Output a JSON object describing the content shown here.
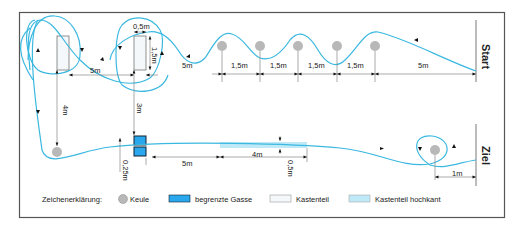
{
  "diagram": {
    "start_label": "Start",
    "finish_label": "Ziel",
    "colors": {
      "path": "#3bb8e0",
      "cone": "#b8b8b8",
      "gate": "#2aa8ee",
      "box": "#f4f8fa",
      "box_upright": "#bfe9f7",
      "frame": "#555555",
      "dim": "#888888"
    },
    "dimensions": {
      "box_width": "0,5m",
      "box_length": "1,5m",
      "boxes_gap": "5m",
      "left_vertical": "4m",
      "mid_vertical": "3m",
      "to_first_cone": "5m",
      "cone_spacing_1": "1,5m",
      "cone_spacing_2": "1,5m",
      "cone_spacing_3": "1,5m",
      "cone_spacing_4": "1,5m",
      "last_cone_to_start": "5m",
      "gate_offset": "0,25m",
      "gate_to_upright": "5m",
      "upright_length": "4m",
      "upright_width": "0,5m",
      "cone_to_finish": "1m"
    }
  },
  "legend": {
    "title": "Zeichenerklärung:",
    "items": [
      {
        "symbol": "cone",
        "label": "Keule"
      },
      {
        "symbol": "gate",
        "label": "begrenzte Gasse"
      },
      {
        "symbol": "box",
        "label": "Kastenteil"
      },
      {
        "symbol": "box-upright",
        "label": "Kastenteil hochkant"
      }
    ]
  }
}
